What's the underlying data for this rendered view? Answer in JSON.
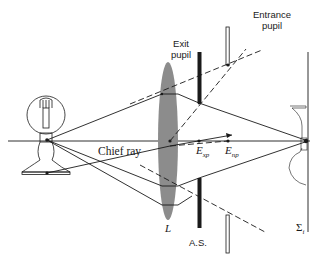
{
  "figure": {
    "labels": {
      "entrance_pupil_line1": "Entrance",
      "entrance_pupil_line2": "pupil",
      "exit_pupil_line1": "Exit",
      "exit_pupil_line2": "pupil",
      "chief_ray": "Chief ray",
      "exit_pupil_point": "E",
      "exit_pupil_point_sub": "xp",
      "entrance_pupil_point": "E",
      "entrance_pupil_point_sub": "np",
      "lens": "L",
      "aperture_stop": "A.S.",
      "image_plane": "Σ",
      "image_plane_sub": "i"
    },
    "colors": {
      "ink": "#1a1a1a",
      "lens_fill": "#8c8c8c",
      "background": "#ffffff"
    },
    "elements": [
      "object-light-bulb",
      "optical-axis",
      "lens-L",
      "aperture-stop-exit-pupil",
      "entrance-pupil",
      "image-plane-sigma-i",
      "inverted-image-bulb",
      "chief-ray",
      "marginal-rays",
      "dashed-construction-lines"
    ]
  }
}
